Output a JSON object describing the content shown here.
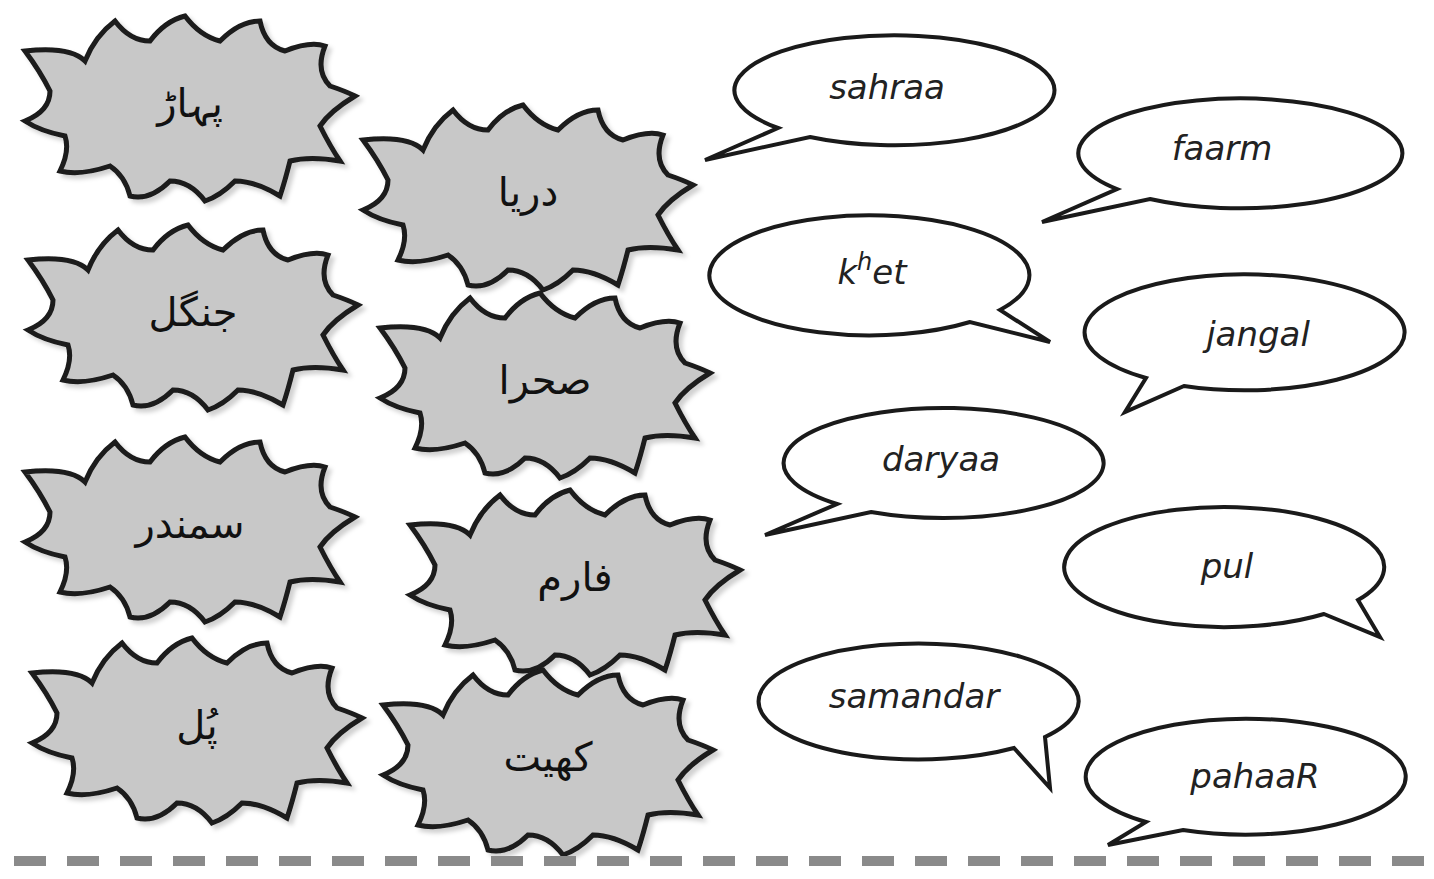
{
  "worksheet": {
    "urdu_cards": [
      {
        "id": "pahaar",
        "text": "پہاڑ",
        "cx": 190,
        "cy": 106
      },
      {
        "id": "darya",
        "text": "دریا",
        "cx": 528,
        "cy": 195
      },
      {
        "id": "jangal",
        "text": "جنگل",
        "cx": 193,
        "cy": 315
      },
      {
        "id": "sahra",
        "text": "صحرا",
        "cx": 545,
        "cy": 383
      },
      {
        "id": "samandar",
        "text": "سمندر",
        "cx": 190,
        "cy": 527
      },
      {
        "id": "farm",
        "text": "فارم",
        "cx": 575,
        "cy": 580
      },
      {
        "id": "pul",
        "text": "پُل",
        "cx": 197,
        "cy": 728
      },
      {
        "id": "khet",
        "text": "کھیت",
        "cx": 548,
        "cy": 760
      }
    ],
    "transliteration_bubbles": [
      {
        "id": "sahraa",
        "text": "sahraa"
      },
      {
        "id": "faarm",
        "text": "faarm"
      },
      {
        "id": "khet",
        "text_base": "k",
        "text_sup": "h",
        "text_rest": "et"
      },
      {
        "id": "jangal",
        "text": "jangal"
      },
      {
        "id": "daryaa",
        "text": "daryaa"
      },
      {
        "id": "pul",
        "text": "pul"
      },
      {
        "id": "samandar",
        "text": "samandar"
      },
      {
        "id": "pahaaR",
        "text": "pahaaR"
      }
    ],
    "colors": {
      "burst_fill": "#c8c8c8",
      "outline": "#1a1a1a",
      "bubble_fill": "#ffffff",
      "cutline": "#8a8a8a"
    }
  }
}
